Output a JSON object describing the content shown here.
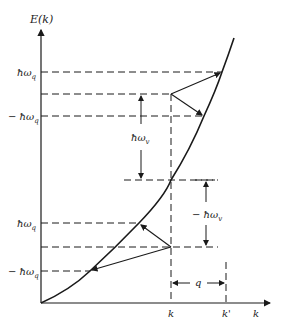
{
  "diagram": {
    "y_axis_label": "E(k)",
    "x_axis_label": "k",
    "left_labels": {
      "hw_q_upper": "ħω",
      "hw_q_upper_sub": "q",
      "neg_hw_q_upper": "− ħω",
      "neg_hw_q_upper_sub": "q",
      "hw_q_lower": "ħω",
      "hw_q_lower_sub": "q",
      "neg_hw_q_lower": "− ħω",
      "neg_hw_q_lower_sub": "q"
    },
    "annotations": {
      "hw_v": "ħω",
      "hw_v_sub": "v",
      "neg_hw_v": "− ħω",
      "neg_hw_v_sub": "v",
      "q": "q"
    },
    "x_ticks": {
      "k": "k",
      "k_prime": "k'"
    },
    "colors": {
      "ink": "#1a1a1a",
      "background": "#ffffff"
    }
  }
}
